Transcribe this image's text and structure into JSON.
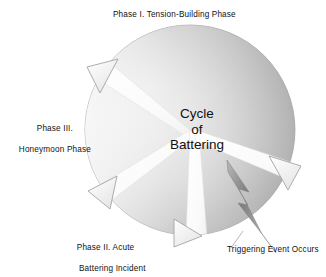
{
  "diagram": {
    "type": "cycle-diagram",
    "title": "Cycle of Battering",
    "center": {
      "line1": "Cycle",
      "line2": "of",
      "line3": "Battering"
    },
    "labels": {
      "phase1": "Phase I. Tension-Building Phase",
      "phase3_line1": "Phase III.",
      "phase3_line2": "Honeymoon Phase",
      "phase2_line1": "Phase II. Acute",
      "phase2_line2": "Battering Incident",
      "trigger": "Triggering Event Occurs"
    },
    "segments": [
      {
        "name": "phase-1-tension-building",
        "label": "Phase I. Tension-Building Phase"
      },
      {
        "name": "phase-2-acute-battering-incident",
        "label": "Phase II. Acute Battering Incident"
      },
      {
        "name": "phase-3-honeymoon",
        "label": "Phase III. Honeymoon Phase"
      }
    ],
    "arrows": [
      {
        "name": "arrow-upper-left",
        "direction": "counterclockwise"
      },
      {
        "name": "arrow-lower-left",
        "direction": "counterclockwise"
      },
      {
        "name": "arrow-bottom",
        "direction": "counterclockwise"
      },
      {
        "name": "arrow-right",
        "direction": "counterclockwise"
      }
    ],
    "icons": [
      {
        "name": "lightning-bolt-icon",
        "meaning": "triggering event"
      }
    ],
    "colors": {
      "background": "#ffffff",
      "sphere_light": "#f4f4f4",
      "sphere_mid": "#cfcfcf",
      "sphere_dark": "#9d9d9d",
      "outline": "#9a9a9a",
      "text": "#111111",
      "bolt": "#8d8d8d"
    }
  }
}
